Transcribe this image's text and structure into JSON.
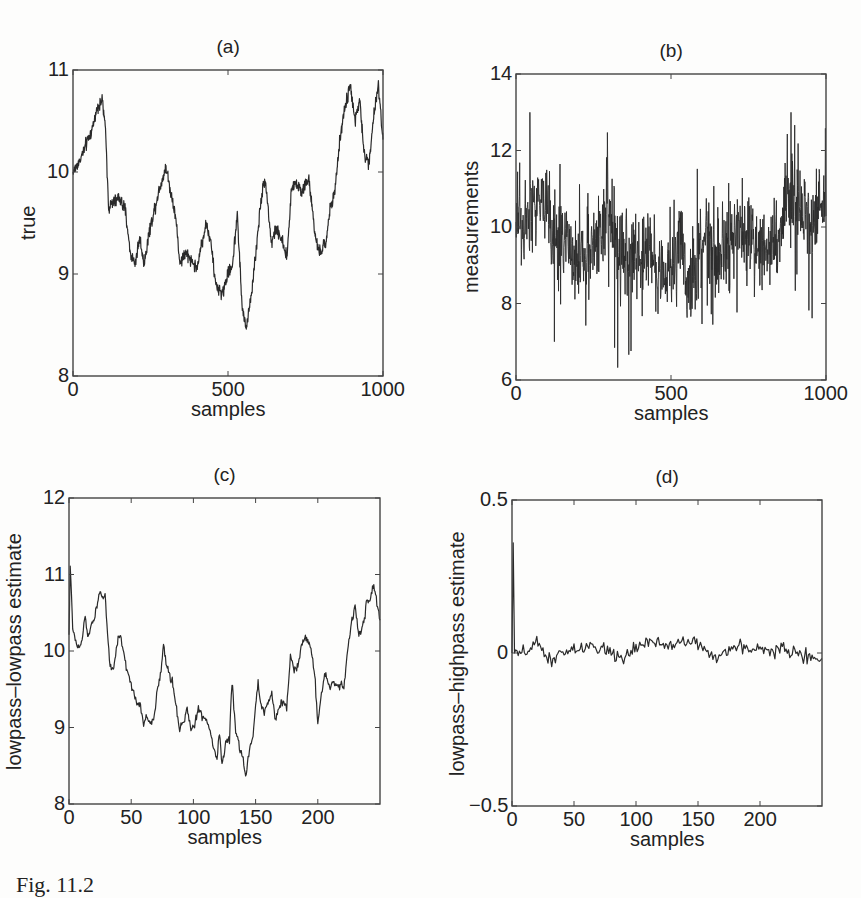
{
  "caption": "Fig. 11.2",
  "chart_data": [
    {
      "id": "a",
      "type": "line",
      "title": "(a)",
      "xlabel": "samples",
      "ylabel": "true",
      "xlim": [
        0,
        1000
      ],
      "ylim": [
        8,
        11
      ],
      "xticks": [
        0,
        500,
        1000
      ],
      "yticks": [
        8,
        9,
        10,
        11
      ],
      "grid": false,
      "noise": 0.06,
      "x": [
        0,
        20,
        40,
        60,
        80,
        95,
        105,
        115,
        130,
        150,
        170,
        185,
        200,
        215,
        230,
        245,
        260,
        280,
        300,
        315,
        330,
        345,
        360,
        380,
        400,
        415,
        430,
        445,
        460,
        480,
        500,
        515,
        530,
        545,
        558,
        575,
        590,
        605,
        620,
        640,
        655,
        670,
        690,
        705,
        720,
        740,
        760,
        780,
        795,
        815,
        830,
        845,
        860,
        875,
        895,
        910,
        925,
        940,
        955,
        970,
        985,
        1000
      ],
      "y": [
        10.0,
        10.1,
        10.25,
        10.4,
        10.65,
        10.7,
        10.4,
        9.65,
        9.7,
        9.75,
        9.6,
        9.2,
        9.1,
        9.35,
        9.1,
        9.4,
        9.6,
        9.85,
        10.05,
        9.8,
        9.6,
        9.1,
        9.2,
        9.15,
        9.05,
        9.3,
        9.5,
        9.3,
        8.9,
        8.8,
        9.0,
        9.1,
        9.6,
        8.7,
        8.45,
        8.8,
        9.2,
        9.7,
        9.95,
        9.3,
        9.45,
        9.35,
        9.15,
        9.85,
        9.9,
        9.8,
        9.95,
        9.4,
        9.2,
        9.3,
        9.65,
        9.8,
        10.3,
        10.6,
        10.85,
        10.5,
        10.7,
        10.15,
        10.1,
        10.55,
        10.85,
        10.3
      ]
    },
    {
      "id": "b",
      "type": "line",
      "title": "(b)",
      "xlabel": "samples",
      "ylabel": "measurements",
      "xlim": [
        0,
        1000
      ],
      "ylim": [
        6,
        14
      ],
      "xticks": [
        0,
        500,
        1000
      ],
      "yticks": [
        6,
        8,
        10,
        12,
        14
      ],
      "grid": false,
      "noise": 1.0,
      "n_points": 1000,
      "underlying": "true signal from (a) plus measurement noise (range ~6.2 to ~13.0)",
      "x": [
        0,
        100,
        200,
        300,
        400,
        500,
        600,
        700,
        800,
        900,
        1000
      ],
      "y": [
        10.3,
        10.6,
        9.4,
        9.8,
        9.1,
        8.9,
        9.2,
        9.8,
        9.7,
        10.5,
        10.6
      ]
    },
    {
      "id": "c",
      "type": "line",
      "title": "(c)",
      "xlabel": "samples",
      "ylabel": "lowpass–lowpass estimate",
      "xlim": [
        0,
        250
      ],
      "ylim": [
        8,
        12
      ],
      "xticks": [
        0,
        50,
        100,
        150,
        200
      ],
      "yticks": [
        8,
        9,
        10,
        11,
        12
      ],
      "grid": false,
      "noise": 0.05,
      "x": [
        0,
        1,
        3,
        6,
        8,
        11,
        13,
        15,
        18,
        21,
        23,
        25,
        27,
        29,
        31,
        33,
        36,
        38,
        40,
        42,
        45,
        48,
        51,
        54,
        57,
        60,
        62,
        65,
        68,
        71,
        74,
        76,
        78,
        81,
        83,
        86,
        89,
        92,
        95,
        98,
        101,
        104,
        107,
        110,
        113,
        116,
        119,
        121,
        123,
        126,
        129,
        131,
        134,
        137,
        140,
        142,
        145,
        148,
        150,
        152,
        154,
        157,
        160,
        163,
        166,
        169,
        172,
        175,
        178,
        181,
        184,
        187,
        190,
        193,
        196,
        198,
        200,
        203,
        206,
        209,
        212,
        215,
        218,
        221,
        224,
        227,
        230,
        233,
        236,
        239,
        242,
        245,
        248,
        250
      ],
      "y": [
        10.2,
        11.1,
        10.3,
        10.1,
        10.0,
        10.2,
        10.45,
        10.2,
        10.35,
        10.45,
        10.65,
        10.8,
        10.7,
        10.75,
        10.2,
        9.8,
        9.75,
        10.0,
        10.2,
        10.15,
        9.85,
        9.65,
        9.5,
        9.35,
        9.3,
        9.05,
        9.15,
        9.05,
        9.1,
        9.5,
        9.7,
        10.1,
        9.85,
        9.65,
        9.6,
        9.3,
        9.0,
        9.05,
        9.25,
        8.95,
        9.05,
        9.25,
        9.15,
        9.1,
        9.0,
        8.75,
        8.6,
        8.95,
        8.5,
        8.8,
        8.85,
        9.6,
        8.95,
        8.75,
        8.6,
        8.35,
        8.7,
        8.9,
        9.3,
        9.6,
        9.3,
        9.2,
        9.35,
        9.45,
        9.05,
        9.3,
        9.35,
        9.25,
        9.95,
        9.75,
        9.8,
        10.1,
        10.2,
        10.1,
        9.9,
        9.6,
        9.05,
        9.45,
        9.7,
        9.55,
        9.6,
        9.55,
        9.55,
        9.55,
        10.0,
        10.35,
        10.6,
        10.2,
        10.3,
        10.6,
        10.7,
        10.85,
        10.6,
        10.4
      ]
    },
    {
      "id": "d",
      "type": "line",
      "title": "(d)",
      "xlabel": "samples",
      "ylabel": "lowpass–highpass estimate",
      "xlim": [
        0,
        250
      ],
      "ylim": [
        -0.5,
        0.5
      ],
      "xticks": [
        0,
        50,
        100,
        150,
        200
      ],
      "yticks": [
        -0.5,
        0,
        0.5
      ],
      "grid": false,
      "noise": 0.022,
      "x": [
        0,
        1,
        2,
        3,
        5,
        10,
        20,
        30,
        50,
        75,
        85,
        100,
        104,
        130,
        147,
        165,
        175,
        200,
        220,
        235,
        250
      ],
      "y": [
        0.0,
        0.36,
        0.0,
        0.01,
        -0.01,
        0.0,
        0.03,
        -0.02,
        0.01,
        0.02,
        -0.02,
        0.01,
        0.03,
        0.03,
        0.04,
        -0.02,
        0.02,
        0.01,
        0.01,
        -0.01,
        -0.02
      ]
    }
  ],
  "layout": {
    "panels": [
      {
        "left": 73,
        "top": 70,
        "width": 310,
        "height": 306
      },
      {
        "left": 516,
        "top": 74,
        "width": 310,
        "height": 306
      },
      {
        "left": 69,
        "top": 498,
        "width": 311,
        "height": 306
      },
      {
        "left": 512,
        "top": 500,
        "width": 310,
        "height": 306
      }
    ],
    "line_color": "#2a2a2a",
    "axis_color": "#444444"
  }
}
